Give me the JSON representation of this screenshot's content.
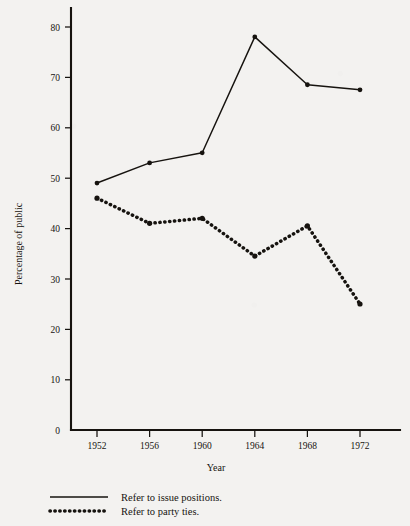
{
  "chart_data": {
    "type": "line",
    "title": "",
    "xlabel": "Year",
    "ylabel": "Percentage of public",
    "categories": [
      "1952",
      "1956",
      "1960",
      "1964",
      "1968",
      "1972"
    ],
    "x": [
      1952,
      1956,
      1960,
      1964,
      1968,
      1972
    ],
    "xlim": [
      1950,
      1974
    ],
    "ylim": [
      0,
      83
    ],
    "ytick_labels": [
      "0",
      "10",
      "20",
      "30",
      "40",
      "50",
      "60",
      "70",
      "80"
    ],
    "ytick_values": [
      0,
      10,
      20,
      30,
      40,
      50,
      60,
      70,
      80
    ],
    "grid": false,
    "legend_position": "bottom-left",
    "series": [
      {
        "name": "Refer to issue positions.",
        "style": "solid",
        "marker": "filled-circle",
        "color": "#16130f",
        "values": [
          49,
          53,
          55,
          78,
          68.5,
          67.5
        ]
      },
      {
        "name": "Refer to party ties.",
        "style": "dotted",
        "marker": "filled-circle",
        "color": "#16130f",
        "values": [
          46,
          41,
          42,
          34.5,
          40.5,
          25
        ]
      }
    ]
  },
  "legend": {
    "items": [
      {
        "label": "Refer to issue positions.",
        "style": "solid"
      },
      {
        "label": "Refer to party ties.",
        "style": "dotted"
      }
    ]
  },
  "axes": {
    "y_title": "Percentage of public",
    "x_title": "Year"
  },
  "colors": {
    "ink": "#16130f",
    "paper": "#f3f2f0"
  }
}
